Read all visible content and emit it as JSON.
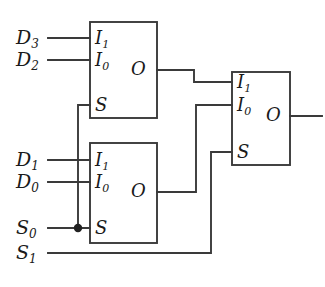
{
  "figure": {
    "type": "logic-circuit-diagram",
    "line_color": "#3a3a3a",
    "text_color": "#1a1a1a",
    "background_color": "#ffffff"
  },
  "inputs": [
    {
      "id": "D3",
      "name": "D",
      "subscript": "3"
    },
    {
      "id": "D2",
      "name": "D",
      "subscript": "2"
    },
    {
      "id": "D1",
      "name": "D",
      "subscript": "1"
    },
    {
      "id": "D0",
      "name": "D",
      "subscript": "0"
    },
    {
      "id": "S0",
      "name": "S",
      "subscript": "0"
    },
    {
      "id": "S1",
      "name": "S",
      "subscript": "1"
    }
  ],
  "blocks": [
    {
      "id": "mux-top",
      "ports": [
        {
          "id": "I1",
          "name": "I",
          "subscript": "1"
        },
        {
          "id": "I0",
          "name": "I",
          "subscript": "0"
        },
        {
          "id": "S",
          "name": "S",
          "subscript": ""
        },
        {
          "id": "O",
          "name": "O",
          "subscript": ""
        }
      ]
    },
    {
      "id": "mux-bottom",
      "ports": [
        {
          "id": "I1",
          "name": "I",
          "subscript": "1"
        },
        {
          "id": "I0",
          "name": "I",
          "subscript": "0"
        },
        {
          "id": "S",
          "name": "S",
          "subscript": ""
        },
        {
          "id": "O",
          "name": "O",
          "subscript": ""
        }
      ]
    },
    {
      "id": "mux-right",
      "ports": [
        {
          "id": "I1",
          "name": "I",
          "subscript": "1"
        },
        {
          "id": "I0",
          "name": "I",
          "subscript": "0"
        },
        {
          "id": "S",
          "name": "S",
          "subscript": ""
        },
        {
          "id": "O",
          "name": "O",
          "subscript": ""
        }
      ]
    }
  ],
  "connections": [
    {
      "from": "D3",
      "to": "mux-top.I1"
    },
    {
      "from": "D2",
      "to": "mux-top.I0"
    },
    {
      "from": "D1",
      "to": "mux-bottom.I1"
    },
    {
      "from": "D0",
      "to": "mux-bottom.I0"
    },
    {
      "from": "S0",
      "to": "mux-top.S"
    },
    {
      "from": "S0",
      "to": "mux-bottom.S"
    },
    {
      "from": "S1",
      "to": "mux-right.S"
    },
    {
      "from": "mux-top.O",
      "to": "mux-right.I1"
    },
    {
      "from": "mux-bottom.O",
      "to": "mux-right.I0"
    },
    {
      "from": "mux-right.O",
      "to": "circuit-output"
    }
  ],
  "junctions": [
    {
      "id": "s0-branch",
      "x": 78,
      "y": 228
    }
  ]
}
